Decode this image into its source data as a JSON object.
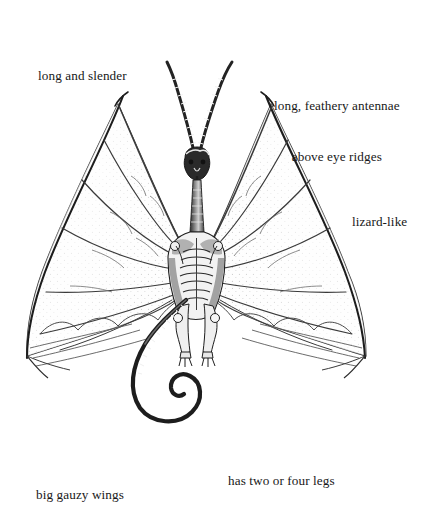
{
  "page": {
    "background_color": "#ffffff",
    "ink_color": "#1a1a1a",
    "width": 429,
    "height": 495
  },
  "illustration": {
    "name": "winged-dragon-figure",
    "description": "Pen-and-ink front view of a winged dragon-like creature with a skull-like head, two long feathery antennae, large gauzy membranous wings, a ribbed torso, two clawed legs, and a long curling spiral tail",
    "parts": [
      "feathery-antennae",
      "head",
      "neck",
      "ribbed-torso",
      "left-wing",
      "right-wing",
      "legs",
      "clawed-feet",
      "spiral-tail"
    ]
  },
  "annotations": [
    {
      "id": "long-slender",
      "lines": [
        "long and slender"
      ]
    },
    {
      "id": "antennae",
      "lines": [
        "long, feathery antennae",
        "above eye ridges"
      ]
    },
    {
      "id": "lizard-like",
      "lines": [
        "lizard-like"
      ]
    },
    {
      "id": "legs",
      "lines": [
        "has two or four legs"
      ]
    },
    {
      "id": "wings",
      "lines": [
        "big gauzy wings"
      ]
    }
  ],
  "labels": {
    "long_slender": "long and slender",
    "antennae_line1": "long, feathery antennae",
    "antennae_line2": "above eye ridges",
    "lizard_like": "lizard-like",
    "legs": "has two or four legs",
    "wings": "big gauzy wings"
  }
}
